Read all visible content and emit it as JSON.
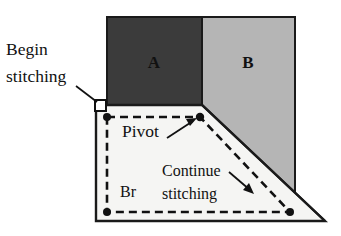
{
  "figure": {
    "name": "quilt-block-stitching-diagram",
    "background_color": "#ffffff",
    "outline_color": "#1a1a1a",
    "dash_color": "#111111"
  },
  "patches": [
    {
      "id": "patch-a",
      "label": "A",
      "fill": "#3b3b3b",
      "label_color": "#000000",
      "label_x": 154,
      "label_y": 68
    },
    {
      "id": "patch-b",
      "label": "B",
      "fill": "#b5b5b5",
      "label_color": "#0d0d0d",
      "label_x": 248,
      "label_y": 68
    },
    {
      "id": "patch-br",
      "label": "Br",
      "fill": "#f5f5f3",
      "label_color": "#111111",
      "label_x": 128,
      "label_y": 197
    }
  ],
  "callouts": [
    {
      "id": "begin-stitching",
      "line1": "Begin",
      "line2": "stitching",
      "x": 6,
      "y1": 55,
      "y2": 82
    },
    {
      "id": "pivot",
      "text": "Pivot",
      "x": 122,
      "y": 137
    },
    {
      "id": "continue-stitching",
      "line1": "Continue",
      "line2": "stitching",
      "x": 162,
      "y1": 176,
      "y2": 199
    }
  ],
  "markers": {
    "begin_square": {
      "x": 98,
      "y": 103
    },
    "dots": [
      {
        "id": "stitch-start-dot",
        "x": 107,
        "y": 117
      },
      {
        "id": "pivot-dot",
        "x": 200,
        "y": 117
      },
      {
        "id": "bottom-left-dot",
        "x": 107,
        "y": 212
      },
      {
        "id": "bottom-right-dot",
        "x": 290,
        "y": 212
      }
    ]
  },
  "stitch_path": {
    "description": "dashed seam line",
    "dash_pattern": "8 5",
    "stroke_width": 2.6
  },
  "caption": ""
}
